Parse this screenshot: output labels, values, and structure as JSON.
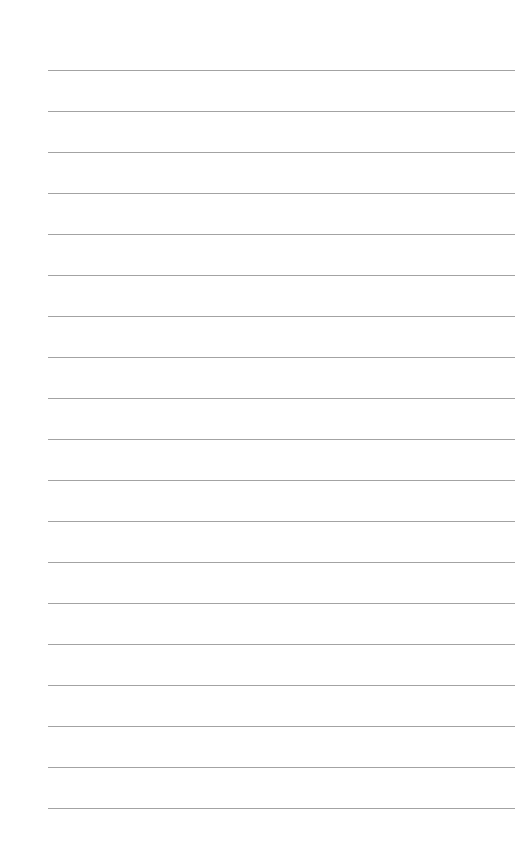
{
  "page": {
    "type": "lined-paper",
    "background_color": "#ffffff",
    "line_color": "#a3a3a3",
    "line_count": 19,
    "first_line_y": 70,
    "line_spacing": 41,
    "line_left": 48,
    "line_right": 515
  }
}
